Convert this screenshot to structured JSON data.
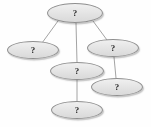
{
  "figure": {
    "type": "node-link-diagram",
    "title": "",
    "background_color": "#fefefe",
    "node_fill_color": "#e6e6e6",
    "node_border_color": "#8f8f8f",
    "node_label_color": "#2a2a2a",
    "edge_color": "#9a9a9a",
    "node_count": 6,
    "edge_count": 5
  },
  "nodes": [
    {
      "id": "n1",
      "name": "node-top",
      "label": "?",
      "cx": 75,
      "cy": 13,
      "rx": 28,
      "ry": 10
    },
    {
      "id": "n2",
      "name": "node-left",
      "label": "?",
      "cx": 33,
      "cy": 50,
      "rx": 26,
      "ry": 9
    },
    {
      "id": "n3",
      "name": "node-right",
      "label": "?",
      "cx": 113,
      "cy": 48,
      "rx": 26,
      "ry": 9
    },
    {
      "id": "n4",
      "name": "node-middle",
      "label": "?",
      "cx": 77,
      "cy": 71,
      "rx": 27,
      "ry": 9
    },
    {
      "id": "n5",
      "name": "node-lower-right",
      "label": "?",
      "cx": 117,
      "cy": 87,
      "rx": 26,
      "ry": 9
    },
    {
      "id": "n6",
      "name": "node-bottom",
      "label": "?",
      "cx": 77,
      "cy": 110,
      "rx": 26,
      "ry": 9
    }
  ],
  "edges": [
    {
      "id": "e1",
      "name": "edge-top-to-left",
      "from": "n1",
      "to": "n2",
      "x1": 58,
      "y1": 21,
      "x2": 42,
      "y2": 43
    },
    {
      "id": "e2",
      "name": "edge-top-to-middle",
      "from": "n1",
      "to": "n4",
      "x1": 76,
      "y1": 23,
      "x2": 77,
      "y2": 62
    },
    {
      "id": "e3",
      "name": "edge-top-to-right",
      "from": "n1",
      "to": "n3",
      "x1": 93,
      "y1": 21,
      "x2": 107,
      "y2": 40
    },
    {
      "id": "e4",
      "name": "edge-right-to-lower-right",
      "from": "n3",
      "to": "n5",
      "x1": 114,
      "y1": 57,
      "x2": 116,
      "y2": 78
    },
    {
      "id": "e5",
      "name": "edge-middle-to-bottom",
      "from": "n4",
      "to": "n6",
      "x1": 77,
      "y1": 80,
      "x2": 77,
      "y2": 101
    }
  ]
}
